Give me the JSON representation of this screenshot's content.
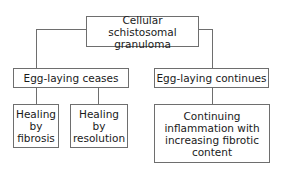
{
  "diagram": {
    "type": "tree",
    "root": {
      "label": "Cellular schistosomal granuloma"
    },
    "level1": [
      {
        "label": "Egg-laying ceases"
      },
      {
        "label": "Egg-laying continues"
      }
    ],
    "level2": [
      {
        "label": "Healing by fibrosis",
        "parent": "Egg-laying ceases"
      },
      {
        "label": "Healing by resolution",
        "parent": "Egg-laying ceases"
      },
      {
        "label": "Continuing inflammation with increasing fibrotic content",
        "parent": "Egg-laying continues"
      }
    ],
    "lines": {
      "root": [
        "Cellular schistosomal",
        "granuloma"
      ],
      "fibrosis": [
        "Healing",
        "by",
        "fibrosis"
      ],
      "resolution": [
        "Healing",
        "by",
        "resolution"
      ],
      "continuing": [
        "Continuing",
        "inflammation with",
        "increasing fibrotic",
        "content"
      ]
    },
    "colors": {
      "border": "#6e6e6e",
      "text": "#1a1a1a",
      "background": "#ffffff"
    }
  }
}
